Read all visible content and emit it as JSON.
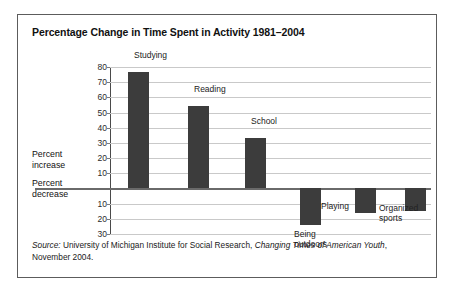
{
  "figure": {
    "title": "Percentage Change in Time Spent in Activity 1981–2004",
    "axis_group_positive": "Percent\nincrease",
    "axis_group_positive_line1": "Percent",
    "axis_group_positive_line2": "increase",
    "axis_group_negative_line1": "Percent",
    "axis_group_negative_line2": "decrease",
    "source_prefix": "Source:",
    "source_text": " University of Michigan Institute for Social Research, ",
    "source_italic": "Changing Times of American Youth",
    "source_suffix": ", November 2004.",
    "bar_color": "#3c3c3c",
    "grid_color": "#c9c9c9",
    "axis_color": "#4a4a4a"
  },
  "chart_data": {
    "type": "bar",
    "title": "Percentage Change in Time Spent in Activity 1981–2004",
    "xlabel": "",
    "ylabel": "Percent increase / Percent decrease",
    "ylim": [
      -30,
      80
    ],
    "grid": true,
    "legend": "none",
    "yticks_positive": [
      80,
      70,
      60,
      50,
      40,
      30,
      20,
      10
    ],
    "yticks_negative": [
      10,
      20,
      30
    ],
    "categories": [
      "Studying",
      "Reading",
      "School",
      "Being outdoors",
      "Playing",
      "Organized sports",
      "Watching TV"
    ],
    "values": [
      77,
      54,
      33,
      -24,
      -16,
      -15,
      -6
    ],
    "bars": [
      {
        "label": "Studying",
        "label_line1": "Studying",
        "label_line2": "",
        "value": 77
      },
      {
        "label": "Reading",
        "label_line1": "Reading",
        "label_line2": "",
        "value": 54
      },
      {
        "label": "School",
        "label_line1": "School",
        "label_line2": "",
        "value": 33
      },
      {
        "label": "Being outdoors",
        "label_line1": "Being",
        "label_line2": "outdoors",
        "value": -24
      },
      {
        "label": "Playing",
        "label_line1": "Playing",
        "label_line2": "",
        "value": -16
      },
      {
        "label": "Organized sports",
        "label_line1": "Organized",
        "label_line2": "sports",
        "value": -15
      },
      {
        "label": "Watching TV",
        "label_line1": "Watching",
        "label_line2": "TV",
        "value": -6
      }
    ]
  }
}
